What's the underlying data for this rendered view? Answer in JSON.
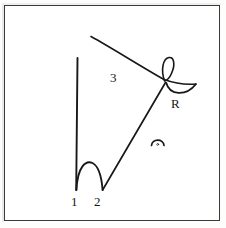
{
  "figure": {
    "kind": "hand-drawn-line-diagram",
    "background_color": "#ffffff",
    "ink_color": "#18181a",
    "frame_color": "#3a3a3a",
    "labels": {
      "stroke_1": "1",
      "stroke_2": "2",
      "stroke_3": "3",
      "point_R": "R"
    },
    "marks": {
      "angle_arc_with_dot": "arc-dot-mark"
    },
    "strokes": [
      {
        "name": "vertical-stroke-1",
        "description": "long near-vertical line descending from upper area to baseline",
        "path": "M 77.5 58 L 76.2 190"
      },
      {
        "name": "arch-stroke",
        "description": "rounded arch connecting foot of stroke 1 to foot of stroke 2",
        "path": "M 76.4 190 C 77.6 166, 86 160, 92.5 163 C 98.5 166, 101.5 176, 102.6 190"
      },
      {
        "name": "diagonal-stroke-2",
        "description": "straight diagonal rising from baseline at 2 to the crossing point R",
        "path": "M 102.6 190 L 165.5 82.5"
      },
      {
        "name": "curve-stroke-3",
        "description": "long concave curve sweeping from upper-left down to the right through the crossing point",
        "path": "M 91 36.5 C 112 48, 140 66, 164 79.5"
      },
      {
        "name": "curve-stroke-3-tail",
        "description": "continuation of curve 3 to the right of the crossing",
        "path": "M 164 79.5 C 175 83.5, 186 84.8, 196 84"
      },
      {
        "name": "loop-stroke",
        "description": "small teardrop loop above the crossing point",
        "path": "M 164.6 81 C 160.5 70, 163 58.5, 169 57.5 C 174.4 56.8, 175.2 65.5, 171.6 73.2 C 169.4 78.2, 166.6 80.4, 164.6 81"
      },
      {
        "name": "bowl-stroke",
        "description": "shallow cup / bowl arc below and right of the crossing point",
        "path": "M 166.2 82.8 C 169.5 95.5, 186 96.5, 195.8 84.2"
      }
    ]
  }
}
